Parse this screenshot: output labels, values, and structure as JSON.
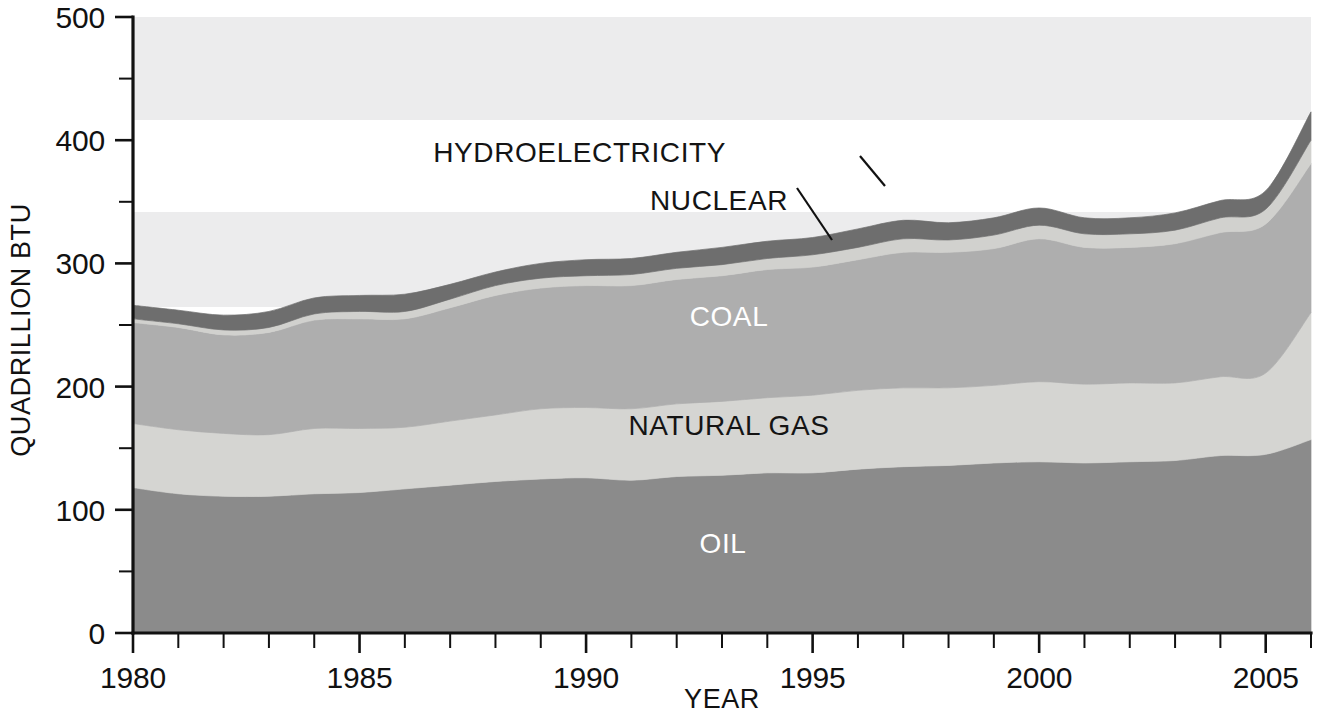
{
  "chart_data": {
    "type": "area",
    "stacked": true,
    "title": "",
    "xlabel": "YEAR",
    "ylabel": "QUADRILLION BTU",
    "xlim": [
      1980,
      2006
    ],
    "ylim": [
      0,
      500
    ],
    "xticks": [
      1980,
      1985,
      1990,
      1995,
      2000,
      2005
    ],
    "xtick_labels": [
      "1980",
      "1985",
      "1990",
      "1995",
      "2000",
      "2005"
    ],
    "xtick_minor_step": 1,
    "yticks": [
      0,
      100,
      200,
      300,
      400,
      500
    ],
    "ytick_labels": [
      "0",
      "100",
      "200",
      "300",
      "400",
      "500"
    ],
    "ytick_minor": [
      50,
      150,
      250,
      350,
      450
    ],
    "grid": false,
    "legend": "inline-labels",
    "x": [
      1980,
      1981,
      1982,
      1983,
      1984,
      1985,
      1986,
      1987,
      1988,
      1989,
      1990,
      1991,
      1992,
      1993,
      1994,
      1995,
      1996,
      1997,
      1998,
      1999,
      2000,
      2001,
      2002,
      2003,
      2004,
      2005,
      2006
    ],
    "series": [
      {
        "name": "OIL",
        "color": "#8b8b8b",
        "label_color": "#ffffff",
        "values": [
          118,
          113,
          111,
          111,
          113,
          114,
          117,
          120,
          123,
          125,
          126,
          124,
          127,
          128,
          130,
          130,
          133,
          135,
          136,
          138,
          139,
          138,
          139,
          140,
          144,
          145,
          157
        ]
      },
      {
        "name": "NATURAL GAS",
        "color": "#d5d5d2",
        "label_color": "#141414",
        "values": [
          52,
          52,
          51,
          50,
          53,
          52,
          50,
          52,
          54,
          57,
          57,
          58,
          59,
          60,
          61,
          63,
          64,
          64,
          63,
          63,
          65,
          64,
          64,
          63,
          64,
          66,
          103
        ]
      },
      {
        "name": "COAL",
        "color": "#aeaeae",
        "label_color": "#ffffff",
        "values": [
          82,
          83,
          80,
          83,
          88,
          89,
          88,
          92,
          97,
          98,
          99,
          100,
          101,
          102,
          104,
          104,
          106,
          110,
          110,
          111,
          116,
          111,
          110,
          113,
          117,
          121,
          121
        ]
      },
      {
        "name": "NUCLEAR",
        "color": "#d1d1ce",
        "label_color": "#141414",
        "values": [
          3,
          3,
          4,
          4,
          5,
          6,
          6,
          7,
          8,
          8,
          8,
          9,
          9,
          9,
          9,
          10,
          10,
          11,
          10,
          11,
          11,
          11,
          11,
          11,
          12,
          12,
          19
        ]
      },
      {
        "name": "HYDROELECTRICITY",
        "color": "#6e6e6e",
        "label_color": "#ffffff",
        "values": [
          11,
          11,
          12,
          13,
          13,
          13,
          14,
          12,
          11,
          12,
          13,
          13,
          13,
          14,
          14,
          14,
          15,
          15,
          14,
          14,
          14,
          13,
          13,
          14,
          14,
          15,
          23
        ]
      }
    ],
    "totals": [
      266,
      262,
      258,
      261,
      272,
      274,
      275,
      283,
      293,
      300,
      303,
      304,
      309,
      313,
      318,
      321,
      328,
      335,
      333,
      337,
      345,
      337,
      337,
      341,
      351,
      359,
      423
    ],
    "annotations": [
      {
        "text": "HYDROELECTRICITY",
        "anchor_x": 726,
        "anchor_y": 162
      },
      {
        "text": "NUCLEAR",
        "anchor_x": 726,
        "anchor_y": 210
      },
      {
        "text": "COAL",
        "anchor_x": 729,
        "anchor_y": 326
      },
      {
        "text": "NATURAL GAS",
        "anchor_x": 729,
        "anchor_y": 435
      },
      {
        "text": "OIL",
        "anchor_x": 723,
        "anchor_y": 553
      }
    ]
  },
  "axes": {
    "y_title": "QUADRILLION BTU",
    "x_title": "YEAR",
    "y_labels": [
      "500",
      "400",
      "300",
      "200",
      "100",
      "0"
    ],
    "x_labels": [
      "1980",
      "1985",
      "1990",
      "1995",
      "2000",
      "2005"
    ]
  },
  "series_labels": {
    "hydro": "HYDROELECTRICITY",
    "nuclear": "NUCLEAR",
    "coal": "COAL",
    "gas": "NATURAL GAS",
    "oil": "OIL"
  },
  "colors": {
    "oil": "#8b8b8b",
    "gas": "#d5d5d2",
    "coal": "#aeaeae",
    "nuclear": "#d1d1ce",
    "hydro": "#6e6e6e",
    "axis": "#111111",
    "background": "#ffffff"
  }
}
